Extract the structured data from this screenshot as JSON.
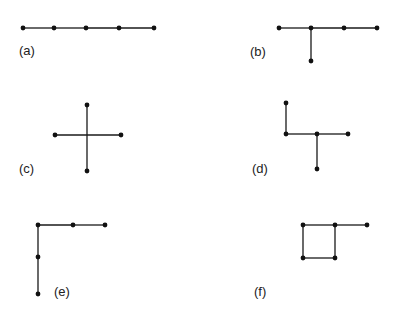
{
  "figure": {
    "panels": [
      {
        "id": "a",
        "label": "(a)",
        "label_pos": [
          19,
          55
        ],
        "nodes": [
          [
            23,
            28
          ],
          [
            54,
            28
          ],
          [
            86,
            28
          ],
          [
            119,
            28
          ],
          [
            154,
            28
          ]
        ],
        "edges": [
          [
            0,
            1
          ],
          [
            1,
            2
          ],
          [
            2,
            3
          ],
          [
            3,
            4
          ]
        ]
      },
      {
        "id": "b",
        "label": "(b)",
        "label_pos": [
          250,
          56
        ],
        "nodes": [
          [
            279,
            28
          ],
          [
            311,
            28
          ],
          [
            344,
            28
          ],
          [
            377,
            28
          ],
          [
            311,
            61
          ]
        ],
        "edges": [
          [
            0,
            1
          ],
          [
            1,
            2
          ],
          [
            2,
            3
          ],
          [
            1,
            4
          ]
        ]
      },
      {
        "id": "c",
        "label": "(c)",
        "label_pos": [
          19,
          173
        ],
        "nodes": [
          [
            87,
            105
          ],
          [
            55,
            135
          ],
          [
            121,
            135
          ],
          [
            87,
            171
          ]
        ],
        "edges": [
          [
            0,
            3
          ],
          [
            1,
            2
          ]
        ]
      },
      {
        "id": "d",
        "label": "(d)",
        "label_pos": [
          252,
          173
        ],
        "nodes": [
          [
            286,
            103
          ],
          [
            286,
            134
          ],
          [
            317,
            134
          ],
          [
            348,
            134
          ],
          [
            317,
            169
          ]
        ],
        "edges": [
          [
            0,
            1
          ],
          [
            1,
            2
          ],
          [
            2,
            3
          ],
          [
            2,
            4
          ]
        ]
      },
      {
        "id": "e",
        "label": "(e)",
        "label_pos": [
          54,
          296
        ],
        "nodes": [
          [
            38,
            225
          ],
          [
            73,
            225
          ],
          [
            105,
            225
          ],
          [
            38,
            257
          ],
          [
            38,
            294
          ]
        ],
        "edges": [
          [
            0,
            1
          ],
          [
            1,
            2
          ],
          [
            0,
            3
          ],
          [
            3,
            4
          ]
        ]
      },
      {
        "id": "f",
        "label": "(f)",
        "label_pos": [
          254,
          296
        ],
        "nodes": [
          [
            303,
            225
          ],
          [
            335,
            225
          ],
          [
            367,
            225
          ],
          [
            303,
            258
          ],
          [
            335,
            258
          ]
        ],
        "edges": [
          [
            0,
            1
          ],
          [
            1,
            2
          ],
          [
            0,
            3
          ],
          [
            3,
            4
          ],
          [
            1,
            4
          ]
        ]
      }
    ],
    "colors": {
      "edge": "#1a1a1a",
      "node": "#111111",
      "label": "#222222",
      "background": "#ffffff"
    }
  }
}
